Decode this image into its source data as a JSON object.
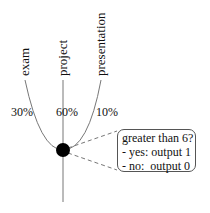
{
  "diagram": {
    "type": "perceptron-node",
    "inputs": [
      {
        "label": "exam",
        "weight": "30%"
      },
      {
        "label": "project",
        "weight": "60%"
      },
      {
        "label": "presentation",
        "weight": "10%"
      }
    ],
    "node": {
      "shape": "filled-circle",
      "color": "#000000"
    },
    "callout": {
      "lines": [
        "greater than 6?",
        "- yes: output 1",
        "- no:  output 0"
      ]
    },
    "colors": {
      "lines": "#666666",
      "node": "#000000",
      "callout_border": "#555555"
    }
  }
}
